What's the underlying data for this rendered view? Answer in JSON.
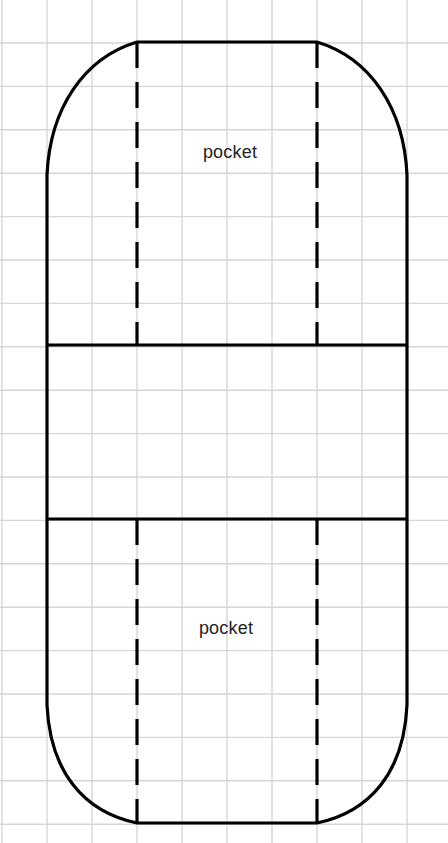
{
  "diagram": {
    "type": "sewing-pattern",
    "colors": {
      "background": "#ffffff",
      "grid": "#d6d6d6",
      "outline": "#000000",
      "text": "#222222"
    },
    "grid": {
      "spacing_x": 45,
      "spacing_y": 43.4,
      "offset_x": 2,
      "offset_y": 43
    },
    "labels": [
      {
        "id": "top-pocket",
        "text": "pocket",
        "x": 230,
        "y": 142
      },
      {
        "id": "bottom-pocket",
        "text": "pocket",
        "x": 226,
        "y": 618
      }
    ],
    "sections": [
      {
        "name": "top-pocket-section",
        "y_top": 42,
        "y_bottom": 345
      },
      {
        "name": "middle-band",
        "y_top": 345,
        "y_bottom": 519
      },
      {
        "name": "bottom-pocket-section",
        "y_top": 519,
        "y_bottom": 823
      }
    ],
    "fold_lines": [
      {
        "name": "left-fold-line",
        "x": 137,
        "style": "dashed"
      },
      {
        "name": "right-fold-line",
        "x": 317,
        "style": "dashed"
      }
    ]
  }
}
